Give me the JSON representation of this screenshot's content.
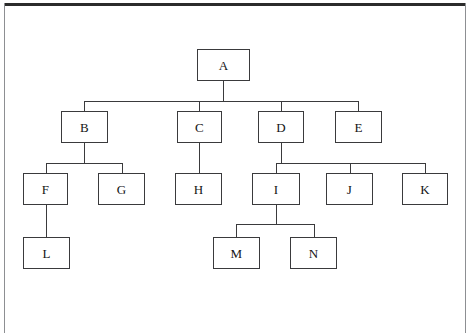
{
  "diagram": {
    "type": "tree",
    "line_color": "#3a3a3c",
    "node_fill": "#ffffff",
    "frame_color": "#8d8f92",
    "nodes": [
      {
        "id": "A",
        "label": "A",
        "x": 197,
        "y": 49,
        "w": 53,
        "h": 32,
        "parent": null
      },
      {
        "id": "B",
        "label": "B",
        "x": 61,
        "y": 111,
        "w": 47,
        "h": 32,
        "parent": "A"
      },
      {
        "id": "C",
        "label": "C",
        "x": 177,
        "y": 111,
        "w": 45,
        "h": 32,
        "parent": "A"
      },
      {
        "id": "D",
        "label": "D",
        "x": 258,
        "y": 111,
        "w": 46,
        "h": 32,
        "parent": "A"
      },
      {
        "id": "E",
        "label": "E",
        "x": 335,
        "y": 111,
        "w": 47,
        "h": 32,
        "parent": "A"
      },
      {
        "id": "F",
        "label": "F",
        "x": 23,
        "y": 173,
        "w": 45,
        "h": 32,
        "parent": "B"
      },
      {
        "id": "G",
        "label": "G",
        "x": 98,
        "y": 173,
        "w": 47,
        "h": 32,
        "parent": "B"
      },
      {
        "id": "H",
        "label": "H",
        "x": 175,
        "y": 173,
        "w": 47,
        "h": 32,
        "parent": "C"
      },
      {
        "id": "I",
        "label": "I",
        "x": 252,
        "y": 173,
        "w": 48,
        "h": 32,
        "parent": "D"
      },
      {
        "id": "J",
        "label": "J",
        "x": 326,
        "y": 173,
        "w": 47,
        "h": 32,
        "parent": "D"
      },
      {
        "id": "K",
        "label": "K",
        "x": 402,
        "y": 173,
        "w": 46,
        "h": 32,
        "parent": "D"
      },
      {
        "id": "L",
        "label": "L",
        "x": 23,
        "y": 237,
        "w": 47,
        "h": 32,
        "parent": "F"
      },
      {
        "id": "M",
        "label": "M",
        "x": 213,
        "y": 237,
        "w": 47,
        "h": 32,
        "parent": "I"
      },
      {
        "id": "N",
        "label": "N",
        "x": 290,
        "y": 237,
        "w": 47,
        "h": 32,
        "parent": "I"
      }
    ],
    "connectors": {
      "A_children": {
        "bus_y": 101,
        "bus_x1": 84,
        "bus_x2": 358,
        "parent_x": 223,
        "parent_bottom": 81,
        "child_top": 111,
        "child_centers": [
          84,
          199,
          281,
          358
        ]
      },
      "B_children": {
        "bus_y": 163,
        "bus_x1": 46,
        "bus_x2": 122,
        "parent_x": 84,
        "parent_bottom": 143,
        "child_top": 173,
        "child_centers": [
          46,
          122
        ]
      },
      "C_children": {
        "bus_y": 163,
        "bus_x1": 199,
        "bus_x2": 199,
        "parent_x": 199,
        "parent_bottom": 143,
        "child_top": 173,
        "child_centers": [
          199
        ]
      },
      "D_children": {
        "bus_y": 163,
        "bus_x1": 276,
        "bus_x2": 425,
        "parent_x": 281,
        "parent_bottom": 143,
        "child_top": 173,
        "child_centers": [
          276,
          350,
          425
        ]
      },
      "F_children": {
        "bus_y": 224,
        "bus_x1": 46,
        "bus_x2": 46,
        "parent_x": 46,
        "parent_bottom": 205,
        "child_top": 237,
        "child_centers": [
          46
        ]
      },
      "I_children": {
        "bus_y": 224,
        "bus_x1": 236,
        "bus_x2": 314,
        "parent_x": 276,
        "parent_bottom": 205,
        "child_top": 237,
        "child_centers": [
          236,
          314
        ]
      }
    },
    "edges": [
      {
        "from": "A",
        "to": "B"
      },
      {
        "from": "A",
        "to": "C"
      },
      {
        "from": "A",
        "to": "D"
      },
      {
        "from": "A",
        "to": "E"
      },
      {
        "from": "B",
        "to": "F"
      },
      {
        "from": "B",
        "to": "G"
      },
      {
        "from": "C",
        "to": "H"
      },
      {
        "from": "D",
        "to": "I"
      },
      {
        "from": "D",
        "to": "J"
      },
      {
        "from": "D",
        "to": "K"
      },
      {
        "from": "F",
        "to": "L"
      },
      {
        "from": "I",
        "to": "M"
      },
      {
        "from": "I",
        "to": "N"
      }
    ]
  }
}
